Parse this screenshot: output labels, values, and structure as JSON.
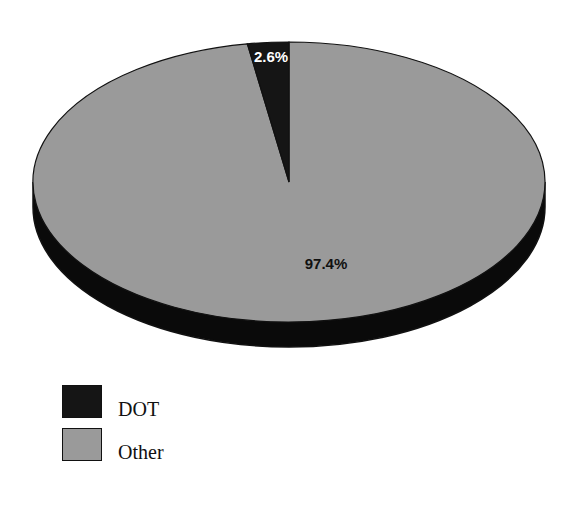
{
  "chart_data": {
    "type": "pie",
    "style": "3d",
    "title": "",
    "title_note": "title cropped at top edge; only descender fragments visible",
    "categories": [
      "DOT",
      "Other"
    ],
    "values": [
      2.6,
      97.4
    ],
    "unit": "%",
    "data_labels": [
      "2.6%",
      "97.4%"
    ],
    "colors": [
      "#151515",
      "#9a9a9a"
    ],
    "legend_position": "bottom-left",
    "start_angle_deg": -90,
    "grid": false
  },
  "labels": {
    "dot_pct": "2.6%",
    "other_pct": "97.4%"
  },
  "legend": {
    "items": [
      {
        "label": "DOT",
        "color": "#151515"
      },
      {
        "label": "Other",
        "color": "#9a9a9a"
      }
    ]
  },
  "colors": {
    "depth": "#0a0a0a",
    "outline": "#111111",
    "background": "#ffffff"
  }
}
